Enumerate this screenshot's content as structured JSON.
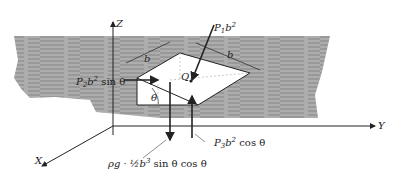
{
  "figure": {
    "axes": {
      "z": "Z",
      "y": "Y",
      "x": "X"
    },
    "dimension_labels": [
      "b",
      "b"
    ],
    "angle_label": "θ",
    "point_label": "Q",
    "forces": {
      "p1": {
        "sym": "P",
        "sub": "1",
        "tail": "b",
        "exp": "2",
        "func": ""
      },
      "p2": {
        "sym": "P",
        "sub": "2",
        "tail": "b",
        "exp": "2",
        "func": "sin θ"
      },
      "p3": {
        "sym": "P",
        "sub": "3",
        "tail": "b",
        "exp": "2",
        "func": "cos θ"
      },
      "weight": {
        "prefix": "ρg · ½",
        "tail": "b",
        "exp": "3",
        "func": "sin θ cos θ"
      }
    },
    "colors": {
      "fluid": "#a9a9a9",
      "fluid_lines": "#6f6f6f",
      "ink": "#222222",
      "dashed": "#bbbbbb"
    }
  }
}
